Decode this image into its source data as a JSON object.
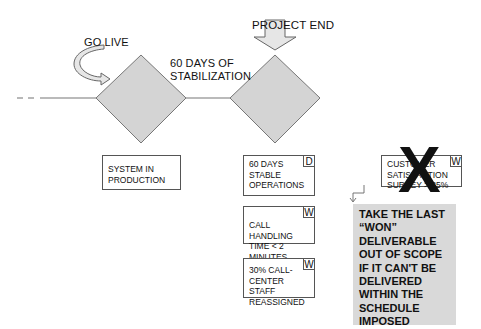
{
  "timeline": {
    "milestones": [
      {
        "id": "go-live",
        "label": "GO LIVE"
      },
      {
        "id": "project-end",
        "label": "PROJECT END"
      }
    ],
    "phase_label_line1": "60 DAYS OF",
    "phase_label_line2": "STABILIZATION"
  },
  "boxes": {
    "system_in_production": {
      "text": "SYSTEM IN PRODUCTION",
      "flag": ""
    },
    "stable_operations": {
      "text": "60 DAYS STABLE OPERATIONS",
      "flag": "D"
    },
    "call_handling": {
      "text": "CALL HANDLING TIME < 2 MINUTES",
      "flag": "W"
    },
    "staff_reassigned": {
      "text": "30% CALL-CENTER STAFF REASSIGNED",
      "flag": "W"
    },
    "customer_survey": {
      "text": "CUSTOMER SATISFACTION SURVEY > 85%",
      "flag": "W",
      "crossed_out": true
    }
  },
  "note": {
    "text": "TAKE THE LAST “WON” DELIVERABLE OUT OF SCOPE IF IT CAN'T BE DELIVERED WITHIN THE SCHEDULE IMPOSED"
  },
  "x_mark": "X",
  "colors": {
    "diamond_fill": "#d4d4d4",
    "line": "#777777",
    "note_fill": "#d9d9d9"
  }
}
